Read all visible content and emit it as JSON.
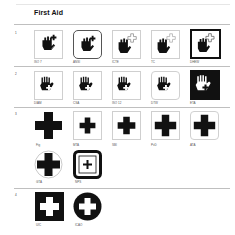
{
  "page": {
    "title": "First Aid",
    "rows": [
      {
        "number": "1",
        "symbols": [
          {
            "label": "ISO 7",
            "frame": "thin-square",
            "icon": "hand-with-plus-icon"
          },
          {
            "label": "ANSI",
            "frame": "rounded-square",
            "icon": "hand-with-plus-icon"
          },
          {
            "label": "ICTE",
            "frame": "thin-square",
            "icon": "hand-with-outline-plus-icon"
          },
          {
            "label": "TC",
            "frame": "thin-square",
            "icon": "hand-with-outline-plus-icon"
          },
          {
            "label": "DHEW",
            "frame": "thick-square",
            "icon": "hand-with-outline-plus-icon"
          }
        ]
      },
      {
        "number": "2",
        "symbols": [
          {
            "label": "DIAM",
            "frame": "thin-square",
            "icon": "hand-cross-palm-icon"
          },
          {
            "label": "CSA",
            "frame": "thin-square",
            "icon": "hand-cross-palm-icon"
          },
          {
            "label": "ISO 12",
            "frame": "thin-square",
            "icon": "hand-cross-palm-icon"
          },
          {
            "label": "DTW",
            "frame": "rounded-square",
            "icon": "hand-cross-palm-icon"
          },
          {
            "label": "ETA",
            "frame": "inverted-square",
            "icon": "hand-cross-palm-inverted-icon"
          }
        ]
      },
      {
        "number": "3",
        "symbols": [
          {
            "label": "Fig",
            "frame": "none",
            "icon": "large-cross-icon"
          },
          {
            "label": "MTA",
            "frame": "thin-square",
            "icon": "cross-icon"
          },
          {
            "label": "SBI",
            "frame": "thin-square",
            "icon": "cross-icon"
          },
          {
            "label": "PvD",
            "frame": "thin-square",
            "icon": "cross-icon"
          },
          {
            "label": "ATA",
            "frame": "rounded-thin-square",
            "icon": "cross-icon"
          },
          {
            "label": "GTA",
            "frame": "thin-circle",
            "icon": "cross-in-circle-icon"
          },
          {
            "label": "NPS",
            "frame": "thick-rounded-square",
            "icon": "small-cross-icon"
          }
        ]
      },
      {
        "number": "4",
        "symbols": [
          {
            "label": "UIC",
            "frame": "filled-square",
            "icon": "white-cross-on-black-square-icon"
          },
          {
            "label": "ICAO",
            "frame": "filled-circle",
            "icon": "white-cross-on-black-circle-icon"
          }
        ]
      }
    ]
  }
}
